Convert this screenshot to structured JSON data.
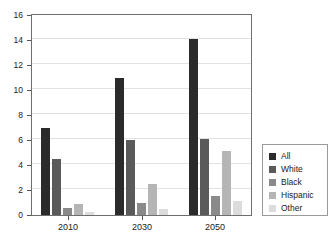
{
  "chart_data": {
    "type": "bar",
    "title": "",
    "subtitle": "",
    "xlabel": "",
    "ylabel": "",
    "categories": [
      "2010",
      "2030",
      "2050"
    ],
    "series": [
      {
        "name": "All",
        "color": "#2b2b2b",
        "values": [
          7.0,
          11.0,
          14.1
        ]
      },
      {
        "name": "White",
        "color": "#5a5a5a",
        "values": [
          4.5,
          6.0,
          6.1
        ]
      },
      {
        "name": "Black",
        "color": "#8a8a8a",
        "values": [
          0.6,
          1.0,
          1.5
        ]
      },
      {
        "name": "Hispanic",
        "color": "#b5b5b5",
        "values": [
          0.9,
          2.5,
          5.1
        ]
      },
      {
        "name": "Other",
        "color": "#dcdcdc",
        "values": [
          0.25,
          0.5,
          1.15
        ]
      }
    ],
    "ylim": [
      0,
      16
    ],
    "y_ticks": [
      0,
      2,
      4,
      6,
      8,
      10,
      12,
      14,
      16
    ],
    "y_tick_labels": [
      "0",
      "2",
      "4",
      "6",
      "8",
      "10",
      "12",
      "14",
      "16"
    ],
    "grid": true,
    "grid_axis": "y",
    "legend_position": "right",
    "legend_entries": [
      "All",
      "White",
      "Black",
      "Hispanic",
      "Other"
    ]
  },
  "axes": {
    "frame_color": "#6e6e6e",
    "grid_color": "#e2e2e2",
    "tick_color": "#555555"
  }
}
